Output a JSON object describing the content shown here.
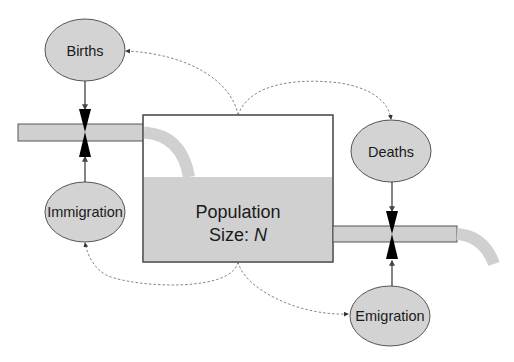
{
  "diagram": {
    "type": "stock-and-flow",
    "stock": {
      "title": "Population",
      "size_label": "Size:",
      "variable": "N"
    },
    "flows": {
      "births": "Births",
      "immigration": "Immigration",
      "deaths": "Deaths",
      "emigration": "Emigration"
    },
    "colors": {
      "ellipse_fill": "#d3d3d3",
      "stock_fill": "#d0d0d0",
      "pipe_fill": "#d0d0d0",
      "outline": "#555555",
      "valve": "#000000",
      "dashed_link": "#666666"
    }
  }
}
